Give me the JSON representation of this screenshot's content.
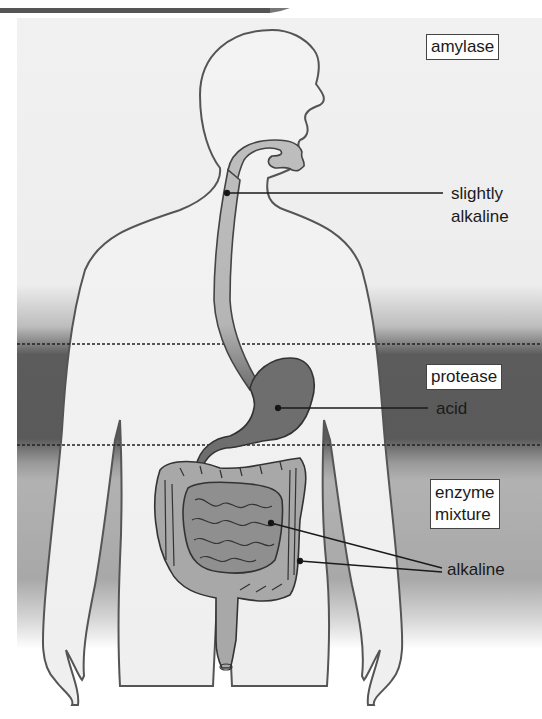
{
  "diagram": {
    "colors": {
      "background_light": "#f0f0f0",
      "band_acid": "#5a5a5a",
      "band_alkaline": "#a9a9a9",
      "body_fill": "#f2f2f2",
      "body_outline": "#555555",
      "organ_fill": "#a8a8a8",
      "stomach_fill": "#6e6e6e",
      "line_color": "#1a1a1a"
    },
    "regions": [
      {
        "name": "mouth",
        "enzyme": "amylase",
        "ph": "slightly alkaline"
      },
      {
        "name": "stomach",
        "enzyme": "protease",
        "ph": "acid"
      },
      {
        "name": "intestines",
        "enzyme": "enzyme mixture",
        "ph": "alkaline"
      }
    ],
    "labels": {
      "amylase": "amylase",
      "slightly": "slightly",
      "alkaline_top": "alkaline",
      "protease": "protease",
      "acid": "acid",
      "enzyme": "enzyme",
      "mixture": "mixture",
      "alkaline_bottom": "alkaline"
    }
  }
}
